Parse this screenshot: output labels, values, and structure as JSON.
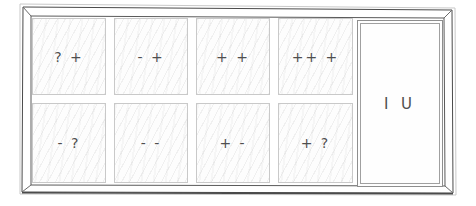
{
  "grid": {
    "rows": [
      {
        "cells": [
          {
            "label": "? +"
          },
          {
            "label": "- +"
          },
          {
            "label": "+ +"
          },
          {
            "label": "++ +"
          }
        ]
      },
      {
        "cells": [
          {
            "label": "- ?"
          },
          {
            "label": "- -"
          },
          {
            "label": "+ -"
          },
          {
            "label": "+ ?"
          }
        ]
      }
    ]
  },
  "side_box": {
    "label": "I U"
  },
  "colors": {
    "background": "#ffffff",
    "frame_line": "#4a4a4a",
    "frame_faint": "#c9c9c9",
    "cell_border": "#c9c9c9",
    "side_box_border": "#8e8e8e",
    "hatch": "#ebebeb",
    "symbol_text": "#4f4f4f"
  }
}
